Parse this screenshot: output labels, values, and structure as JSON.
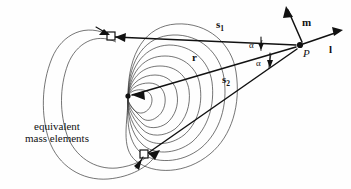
{
  "figure": {
    "background_color": "#fefefe",
    "stroke_color": "#111111",
    "contour_color": "#3a3a3a",
    "width": 351,
    "height": 189
  },
  "labels": {
    "caption_line1": "equivalent",
    "caption_line2": "mass elements",
    "vector_s1": "s",
    "vector_s1_sub": "1",
    "vector_s2": "s",
    "vector_s2_sub": "2",
    "vector_r": "r",
    "vector_m": "m",
    "vector_l": "l",
    "point_p": "P",
    "angle_alpha_upper": "α",
    "angle_alpha_lower": "α"
  },
  "geometry": {
    "point_p": {
      "x": 299,
      "y": 45
    },
    "center": {
      "x": 128,
      "y": 96
    },
    "mass_element_upper": {
      "x": 111,
      "y": 36
    },
    "mass_element_lower": {
      "x": 144,
      "y": 155
    },
    "contour_count": 8
  }
}
